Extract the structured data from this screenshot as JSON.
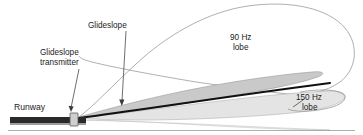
{
  "diagram": {
    "background_color": "#ffffff",
    "labels": {
      "runway": "Runway",
      "glideslope": "Glideslope",
      "transmitter_line1": "Glideslope",
      "transmitter_line2": "transmitter",
      "lobe_90_line1": "90 Hz",
      "lobe_90_line2": "lobe",
      "lobe_150_line1": "150 Hz",
      "lobe_150_line2": "lobe"
    },
    "colors": {
      "lobe_90_outline": "#8d8d8d",
      "lobe_upper_fill": "#c9c9c9",
      "lobe_lower_fill": "#e4e4e4",
      "lobe_ground_fill": "#efefef",
      "glideslope_line": "#111111",
      "runway": "#2a2a2a",
      "transmitter_box": "#cfcfcf",
      "text": "#1c1c1c",
      "leader_line": "#4a4a4a"
    },
    "elements": {
      "runway_bar": {
        "x": 10,
        "y": 117,
        "width": 76,
        "height": 6
      },
      "transmitter_box": {
        "x": 70,
        "y": 113,
        "width": 8,
        "height": 13
      },
      "glideslope_origin": {
        "x": 78,
        "y": 117
      },
      "glideslope_end": {
        "x": 330,
        "y": 83
      },
      "ground_line_y": 130
    }
  }
}
